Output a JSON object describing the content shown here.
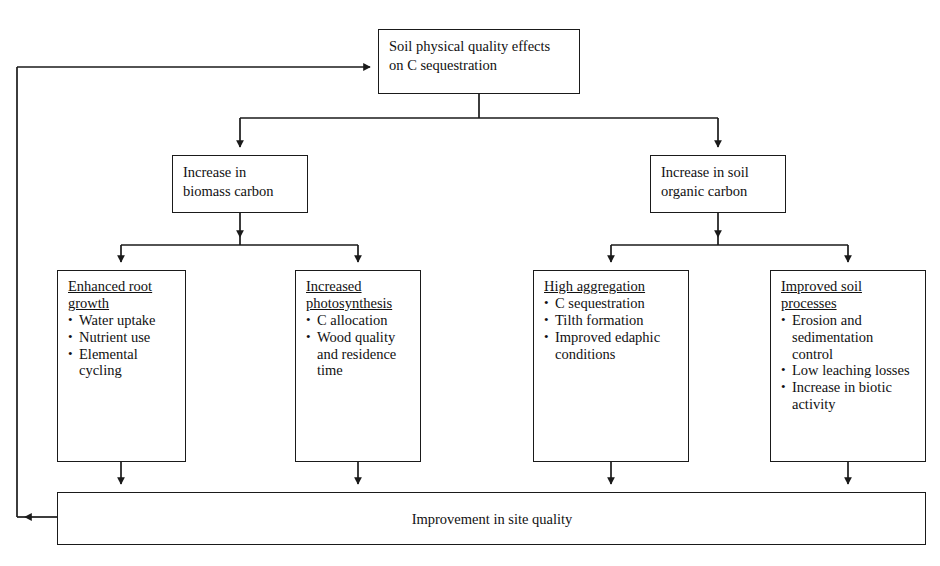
{
  "diagram": {
    "line_color": "#1a1a1a",
    "background_color": "#ffffff"
  },
  "nodes": {
    "top": {
      "text": "Soil physical quality effects\non C sequestration"
    },
    "mid_left": {
      "text": "Increase in\nbiomass carbon"
    },
    "mid_right": {
      "text": "Increase in soil\norganic carbon"
    },
    "leaf_1": {
      "heading": "Enhanced root growth",
      "bullets": [
        "Water uptake",
        "Nutrient use",
        "Elemental cycling"
      ]
    },
    "leaf_2": {
      "heading": "Increased photosynthesis",
      "bullets": [
        "C allocation",
        "Wood quality and residence time"
      ]
    },
    "leaf_3": {
      "heading": "High aggregation",
      "bullets": [
        "C sequestration",
        "Tilth formation",
        "Improved edaphic conditions"
      ]
    },
    "leaf_4": {
      "heading": "Improved soil processes",
      "bullets": [
        "Erosion and sedimentation control",
        "Low leaching losses",
        "Increase in biotic activity"
      ]
    },
    "bottom": {
      "text": "Improvement in site quality"
    }
  },
  "connectors": [
    {
      "name": "top-to-bus",
      "from": "top",
      "to": "level-1-bus"
    },
    {
      "name": "bus-to-mid-left",
      "from": "level-1-bus",
      "to": "mid_left"
    },
    {
      "name": "bus-to-mid-right",
      "from": "level-1-bus",
      "to": "mid_right"
    },
    {
      "name": "mid-left-to-bus",
      "from": "mid_left",
      "to": "level-2-left-bus"
    },
    {
      "name": "bus-to-leaf-1",
      "from": "level-2-left-bus",
      "to": "leaf_1"
    },
    {
      "name": "bus-to-leaf-2",
      "from": "level-2-left-bus",
      "to": "leaf_2"
    },
    {
      "name": "mid-right-to-bus",
      "from": "mid_right",
      "to": "level-2-right-bus"
    },
    {
      "name": "bus-to-leaf-3",
      "from": "level-2-right-bus",
      "to": "leaf_3"
    },
    {
      "name": "bus-to-leaf-4",
      "from": "level-2-right-bus",
      "to": "leaf_4"
    },
    {
      "name": "leaf-1-to-bottom",
      "from": "leaf_1",
      "to": "bottom"
    },
    {
      "name": "leaf-2-to-bottom",
      "from": "leaf_2",
      "to": "bottom"
    },
    {
      "name": "leaf-3-to-bottom",
      "from": "leaf_3",
      "to": "bottom"
    },
    {
      "name": "leaf-4-to-bottom",
      "from": "leaf_4",
      "to": "bottom"
    },
    {
      "name": "feedback-loop",
      "from": "bottom",
      "to": "top"
    }
  ]
}
